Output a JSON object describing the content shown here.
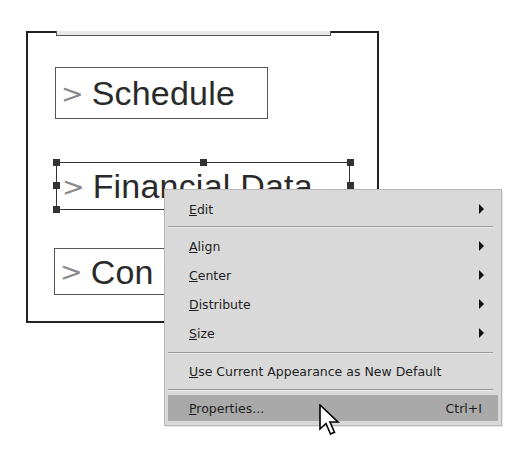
{
  "canvas": {
    "fields": [
      {
        "chevron": ">",
        "label": "Schedule"
      },
      {
        "chevron": ">",
        "label": "Financial Data",
        "selected": true
      },
      {
        "chevron": ">",
        "label": "Con"
      }
    ]
  },
  "context_menu": {
    "items": [
      {
        "label": "Edit",
        "mnemonic": "E",
        "rest": "dit",
        "submenu": true
      },
      {
        "label": "Align",
        "mnemonic": "A",
        "rest": "lign",
        "submenu": true
      },
      {
        "label": "Center",
        "mnemonic": "C",
        "rest": "enter",
        "submenu": true
      },
      {
        "label": "Distribute",
        "mnemonic": "D",
        "rest": "istribute",
        "submenu": true
      },
      {
        "label": "Size",
        "mnemonic": "S",
        "rest": "ize",
        "submenu": true
      },
      {
        "label": "Use Current Appearance as New Default",
        "mnemonic": "U",
        "rest": "se Current Appearance as New Default",
        "submenu": false
      },
      {
        "label": "Properties...",
        "mnemonic": "P",
        "rest": "roperties...",
        "shortcut": "Ctrl+I",
        "highlighted": true
      }
    ]
  },
  "colors": {
    "menu_bg": "#d9d9d9",
    "menu_highlight": "#a9a9a9",
    "frame_border": "#222222",
    "chevron": "#8a8a8a"
  }
}
